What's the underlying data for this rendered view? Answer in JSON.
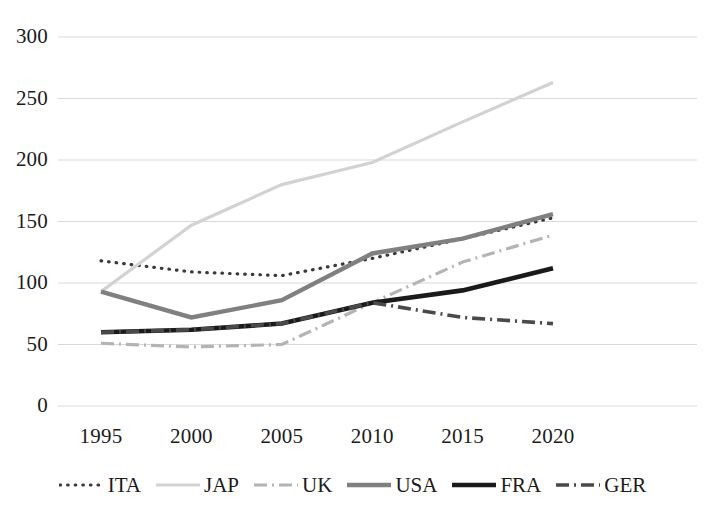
{
  "chart_data": {
    "type": "line",
    "title": "",
    "subtitle": "",
    "xlabel": "",
    "ylabel": "",
    "x": [
      1995,
      2000,
      2005,
      2010,
      2015,
      2020
    ],
    "categories": [
      "1995",
      "2000",
      "2005",
      "2010",
      "2015",
      "2020"
    ],
    "xtick_labels": [
      "1995",
      "2000",
      "2005",
      "2010",
      "2015",
      "2020"
    ],
    "ytick_labels": [
      "0",
      "50",
      "100",
      "150",
      "200",
      "250",
      "300"
    ],
    "yticks": [
      0,
      50,
      100,
      150,
      200,
      250,
      300
    ],
    "ylim": [
      0,
      300
    ],
    "xlim": [
      1995,
      2020
    ],
    "grid": "horizontal",
    "legend_position": "bottom",
    "series": [
      {
        "name": "ITA",
        "label": "ITA",
        "values": [
          118,
          109,
          106,
          120,
          136,
          153
        ],
        "color": "#3a3a3a",
        "style": "dotted",
        "width": 3.2
      },
      {
        "name": "JAP",
        "label": "JAP",
        "values": [
          93,
          147,
          180,
          198,
          231,
          263
        ],
        "color": "#d2d2d2",
        "style": "solid",
        "width": 3.2
      },
      {
        "name": "UK",
        "label": "UK",
        "values": [
          51,
          48,
          50,
          84,
          117,
          139
        ],
        "color": "#b4b4b4",
        "style": "dashdot",
        "width": 3.2
      },
      {
        "name": "USA",
        "label": "USA",
        "values": [
          93,
          72,
          86,
          124,
          136,
          156
        ],
        "color": "#808080",
        "style": "solid",
        "width": 4.4
      },
      {
        "name": "FRA",
        "label": "FRA",
        "values": [
          60,
          62,
          67,
          84,
          94,
          112
        ],
        "color": "#1a1a1a",
        "style": "solid",
        "width": 4.6
      },
      {
        "name": "GER",
        "label": "GER",
        "values": [
          60,
          62,
          67,
          84,
          72,
          67
        ],
        "color": "#4a4a4a",
        "style": "dashdot",
        "width": 3.6
      }
    ]
  },
  "axes": {
    "grid_color": "#d9d9d9",
    "text_color": "#1b1b1b"
  },
  "legend": {
    "items": [
      {
        "label": "ITA"
      },
      {
        "label": "JAP"
      },
      {
        "label": "UK"
      },
      {
        "label": "USA"
      },
      {
        "label": "FRA"
      },
      {
        "label": "GER"
      }
    ]
  }
}
